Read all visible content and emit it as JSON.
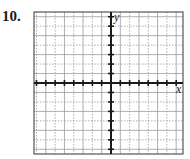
{
  "problem": {
    "number": "10."
  },
  "graph": {
    "x_axis_label": "x",
    "y_axis_label": "y",
    "box": {
      "left": 34,
      "top": 12,
      "right": 183,
      "bottom": 154
    },
    "origin": {
      "x": 111,
      "y": 83
    },
    "columns": 16,
    "rows": 15,
    "grid_color": "#9a9a9a",
    "axis_color": "#1a1a1a",
    "border_color": "#555555"
  }
}
